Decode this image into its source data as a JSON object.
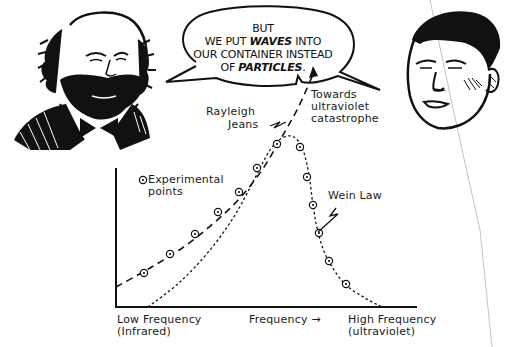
{
  "speech_bubble": {
    "line1": "BUT",
    "line2_pre": "WE PUT ",
    "line2_bold": "WAVES",
    "line2_post": " INTO",
    "line3": "OUR CONTAINER INSTEAD",
    "line4_pre": "OF ",
    "line4_bold": "PARTICLES",
    "line4_post": "."
  },
  "figures": {
    "left": "bearded-scientist-portrait",
    "right": "young-scientist-portrait"
  },
  "labels": {
    "rayleigh_jeans_1": "Rayleigh",
    "rayleigh_jeans_2": "Jeans",
    "towards_1": "Towards",
    "towards_2": "ultraviolet",
    "towards_3": "catastrophe",
    "wein_law": "Wein Law",
    "legend_1": "Experimental",
    "legend_2": "points",
    "x_low_1": "Low Frequency",
    "x_low_2": "(Infrared)",
    "x_mid": "Frequency →",
    "x_high_1": "High Frequency",
    "x_high_2": "(ultraviolet)"
  },
  "chart_data": {
    "type": "line",
    "title": "",
    "xlabel": "Frequency →",
    "ylabel": "",
    "x_tick_labels": [
      "Low Frequency (Infrared)",
      "High Frequency (ultraviolet)"
    ],
    "grid": false,
    "legend": [
      {
        "marker": "circled-dot",
        "label": "Experimental points"
      }
    ],
    "series": [
      {
        "name": "Rayleigh Jeans",
        "style": "long-dash",
        "note": "Towards ultraviolet catastrophe (diverges upward)",
        "points_px": [
          [
            116,
            287
          ],
          [
            150,
            268
          ],
          [
            185,
            246
          ],
          [
            215,
            222
          ],
          [
            240,
            198
          ],
          [
            262,
            170
          ],
          [
            280,
            140
          ],
          [
            298,
            108
          ],
          [
            314,
            72
          ]
        ]
      },
      {
        "name": "Wein Law",
        "style": "short-dash",
        "points_px": [
          [
            148,
            307
          ],
          [
            180,
            282
          ],
          [
            210,
            250
          ],
          [
            235,
            215
          ],
          [
            255,
            178
          ],
          [
            270,
            150
          ],
          [
            282,
            138
          ],
          [
            294,
            137
          ],
          [
            303,
            150
          ],
          [
            309,
            175
          ],
          [
            313,
            205
          ],
          [
            318,
            232
          ],
          [
            327,
            258
          ],
          [
            344,
            283
          ],
          [
            365,
            298
          ],
          [
            382,
            307
          ]
        ]
      },
      {
        "name": "Experimental points",
        "style": "circled-dot",
        "points_px": [
          [
            144,
            273
          ],
          [
            170,
            254
          ],
          [
            195,
            234
          ],
          [
            218,
            212
          ],
          [
            239,
            192
          ],
          [
            257,
            168
          ],
          [
            277,
            144
          ],
          [
            300,
            147
          ],
          [
            307,
            177
          ],
          [
            313,
            205
          ],
          [
            319,
            233
          ],
          [
            329,
            261
          ],
          [
            346,
            284
          ]
        ]
      }
    ],
    "axes_px": {
      "origin": [
        116,
        307
      ],
      "x_end": 417,
      "y_top": 168
    }
  },
  "colors": {
    "ink": "#1a1a1a",
    "paper": "#ffffff",
    "fold": "#bdbdbd"
  }
}
